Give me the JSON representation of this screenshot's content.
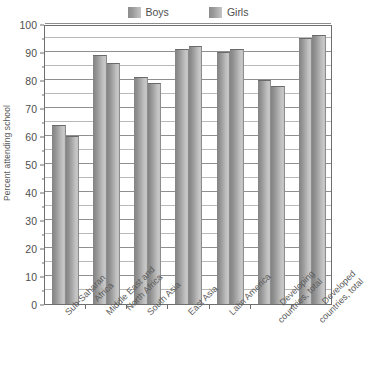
{
  "chart_data": {
    "type": "bar",
    "title": "",
    "xlabel": "",
    "ylabel": "Percent attending school",
    "ylim": [
      0,
      100
    ],
    "ytick_step": 10,
    "minor_gridline_step": 5,
    "grid": true,
    "legend_position": "top-center",
    "categories": [
      "Sub-Saharan Africa",
      "Middle East and North Africa",
      "South Asia",
      "East Asia",
      "Latin America",
      "Developing countries, total",
      "Developed countries, total"
    ],
    "category_lines": [
      [
        "Sub-Saharan",
        "Africa"
      ],
      [
        "Middle East and",
        "North Africa"
      ],
      [
        "South Asia",
        ""
      ],
      [
        "East Asia",
        ""
      ],
      [
        "Latin America",
        ""
      ],
      [
        "Developing",
        "countries, total"
      ],
      [
        "Developed",
        "countries, total"
      ]
    ],
    "series": [
      {
        "name": "Boys",
        "values": [
          64,
          89,
          81,
          91,
          90,
          80,
          95
        ]
      },
      {
        "name": "Girls",
        "values": [
          60,
          86,
          79,
          92,
          91,
          78,
          96
        ]
      }
    ],
    "ytick_labels": [
      "0",
      "10",
      "20",
      "30",
      "40",
      "50",
      "60",
      "70",
      "80",
      "90",
      "100"
    ],
    "bar_color_dark": "#848484",
    "bar_color_light": "#c9c9c9",
    "frame_color": "#6f6f6f",
    "gridline_color": "#8f8f8f"
  },
  "legend": {
    "entries": [
      {
        "label": "Boys"
      },
      {
        "label": "Girls"
      }
    ]
  },
  "caption": {
    "text": ""
  }
}
